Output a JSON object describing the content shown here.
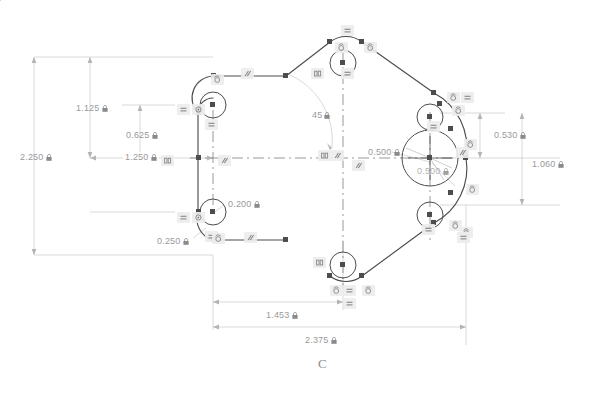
{
  "drawing": {
    "type": "cad-sketch",
    "title_letter": "C",
    "background_color": "#ffffff",
    "geometry_color": "#4a4a4a",
    "dimension_color": "#9a9a9a",
    "centerline_color": "#7a7a7a",
    "constraint_badge_color": "#ededed"
  },
  "dimensions": [
    {
      "id": "d-2250",
      "value": "2.250",
      "locked": true,
      "kind": "linear-vertical",
      "x": 20,
      "y": 156
    },
    {
      "id": "d-1125",
      "value": "1.125",
      "locked": true,
      "kind": "linear-vertical",
      "x": 76,
      "y": 107
    },
    {
      "id": "d-0625",
      "value": "0.625",
      "locked": true,
      "kind": "linear-vertical",
      "x": 126,
      "y": 134
    },
    {
      "id": "d-1250",
      "value": "1.250",
      "locked": true,
      "kind": "linear-horizontal",
      "x": 123,
      "y": 157
    },
    {
      "id": "d-0200",
      "value": "0.200",
      "locked": true,
      "kind": "radius",
      "x": 228,
      "y": 203
    },
    {
      "id": "d-0250",
      "value": "0.250",
      "locked": true,
      "kind": "radius",
      "x": 157,
      "y": 240
    },
    {
      "id": "d-45",
      "value": "45",
      "locked": true,
      "kind": "angular",
      "x": 312,
      "y": 114
    },
    {
      "id": "d-0500-left",
      "value": "0.500",
      "locked": true,
      "kind": "radius",
      "x": 368,
      "y": 151
    },
    {
      "id": "d-0500-lower",
      "value": "0.500",
      "locked": true,
      "kind": "radius",
      "x": 417,
      "y": 170
    },
    {
      "id": "d-0530",
      "value": "0.530",
      "locked": true,
      "kind": "linear-vertical",
      "x": 494,
      "y": 134
    },
    {
      "id": "d-1060",
      "value": "1.060",
      "locked": true,
      "kind": "linear-vertical",
      "x": 532,
      "y": 163
    },
    {
      "id": "d-1453",
      "value": "1.453",
      "locked": true,
      "kind": "linear-horizontal",
      "x": 264,
      "y": 314
    },
    {
      "id": "d-2375",
      "value": "2.375",
      "locked": true,
      "kind": "linear-horizontal",
      "x": 303,
      "y": 337
    }
  ],
  "constraints": [
    {
      "id": "c01",
      "glyph": "equal",
      "x": 177,
      "y": 104
    },
    {
      "id": "c02",
      "glyph": "coincident",
      "x": 192,
      "y": 104
    },
    {
      "id": "c03",
      "glyph": "equal",
      "x": 205,
      "y": 119
    },
    {
      "id": "c04",
      "glyph": "tangent",
      "x": 211,
      "y": 74
    },
    {
      "id": "c05",
      "glyph": "parallel",
      "x": 241,
      "y": 68
    },
    {
      "id": "c06",
      "glyph": "perp",
      "x": 161,
      "y": 155
    },
    {
      "id": "c07",
      "glyph": "parallel",
      "x": 218,
      "y": 155
    },
    {
      "id": "c08",
      "glyph": "equal",
      "x": 177,
      "y": 212
    },
    {
      "id": "c09",
      "glyph": "coincident",
      "x": 192,
      "y": 212
    },
    {
      "id": "c10",
      "glyph": "equal",
      "x": 205,
      "y": 231
    },
    {
      "id": "c11",
      "glyph": "tangent",
      "x": 212,
      "y": 233
    },
    {
      "id": "c12",
      "glyph": "parallel",
      "x": 244,
      "y": 232
    },
    {
      "id": "c13",
      "glyph": "equal",
      "x": 341,
      "y": 25
    },
    {
      "id": "c14",
      "glyph": "tangent",
      "x": 335,
      "y": 42
    },
    {
      "id": "c15",
      "glyph": "tangent",
      "x": 364,
      "y": 42
    },
    {
      "id": "c16",
      "glyph": "perp",
      "x": 311,
      "y": 68
    },
    {
      "id": "c17",
      "glyph": "equal",
      "x": 341,
      "y": 68
    },
    {
      "id": "c18",
      "glyph": "perp",
      "x": 318,
      "y": 150
    },
    {
      "id": "c19",
      "glyph": "parallel",
      "x": 331,
      "y": 150
    },
    {
      "id": "c20",
      "glyph": "parallel",
      "x": 352,
      "y": 160
    },
    {
      "id": "c21",
      "glyph": "tangent",
      "x": 447,
      "y": 92
    },
    {
      "id": "c22",
      "glyph": "equal",
      "x": 461,
      "y": 92
    },
    {
      "id": "c23",
      "glyph": "tangent",
      "x": 452,
      "y": 105
    },
    {
      "id": "c24",
      "glyph": "equal",
      "x": 427,
      "y": 121
    },
    {
      "id": "c25",
      "glyph": "tangent",
      "x": 464,
      "y": 139
    },
    {
      "id": "c26",
      "glyph": "parallel",
      "x": 456,
      "y": 147
    },
    {
      "id": "c27",
      "glyph": "tangent",
      "x": 466,
      "y": 184
    },
    {
      "id": "c28",
      "glyph": "equal",
      "x": 422,
      "y": 224
    },
    {
      "id": "c29",
      "glyph": "tangent",
      "x": 449,
      "y": 220
    },
    {
      "id": "c30",
      "glyph": "tangent",
      "x": 460,
      "y": 227
    },
    {
      "id": "c31",
      "glyph": "equal",
      "x": 457,
      "y": 232
    },
    {
      "id": "c32",
      "glyph": "perp",
      "x": 313,
      "y": 257
    },
    {
      "id": "c33",
      "glyph": "tangent",
      "x": 330,
      "y": 285
    },
    {
      "id": "c34",
      "glyph": "equal",
      "x": 343,
      "y": 285
    },
    {
      "id": "c35",
      "glyph": "tangent",
      "x": 362,
      "y": 285
    },
    {
      "id": "c36",
      "glyph": "equal",
      "x": 343,
      "y": 298
    }
  ]
}
